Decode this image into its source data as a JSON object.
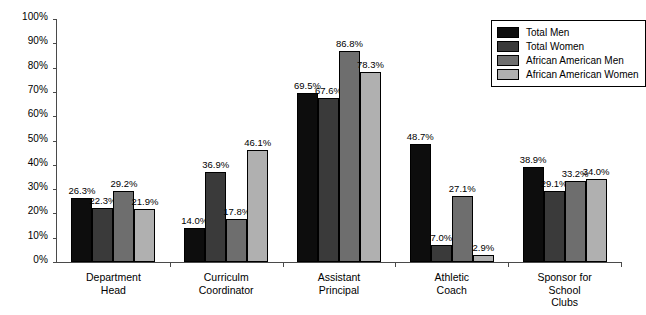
{
  "chart_data": {
    "type": "bar",
    "title": "",
    "xlabel": "",
    "ylabel": "",
    "ylim": [
      0,
      100
    ],
    "grid": false,
    "legend_position": "top-right",
    "categories": [
      "Department\nHead",
      "Curriculm\nCoordinator",
      "Assistant\nPrincipal",
      "Athletic\nCoach",
      "Sponsor for\nSchool\nClubs"
    ],
    "ytick_labels": [
      "0%",
      "10%",
      "20%",
      "30%",
      "40%",
      "50%",
      "60%",
      "70%",
      "80%",
      "90%",
      "100%"
    ],
    "ytick_values": [
      0,
      10,
      20,
      30,
      40,
      50,
      60,
      70,
      80,
      90,
      100
    ],
    "series": [
      {
        "name": "Total Men",
        "color": "#0d0d0d",
        "values": [
          26.3,
          14.0,
          69.5,
          48.7,
          38.9
        ],
        "labels": [
          "26.3%",
          "14.0%",
          "69.5%",
          "48.7%",
          "38.9%"
        ]
      },
      {
        "name": "Total Women",
        "color": "#3a3a3a",
        "values": [
          22.3,
          36.9,
          67.6,
          7.0,
          29.1
        ],
        "labels": [
          "22.3%",
          "36.9%",
          "67.6%",
          "7.0%",
          "29.1%"
        ]
      },
      {
        "name": "African American Men",
        "color": "#6e6e6e",
        "values": [
          29.2,
          17.8,
          86.8,
          27.1,
          33.2
        ],
        "labels": [
          "29.2%",
          "17.8%",
          "86.8%",
          "27.1%",
          "33.2%"
        ]
      },
      {
        "name": "African American Women",
        "color": "#b0b0b0",
        "values": [
          21.9,
          46.1,
          78.3,
          2.9,
          34.0
        ],
        "labels": [
          "21.9%",
          "46.1%",
          "78.3%",
          "2.9%",
          "34.0%"
        ]
      }
    ]
  }
}
